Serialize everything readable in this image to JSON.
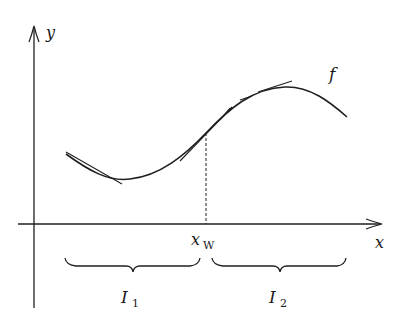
{
  "diagram": {
    "axes": {
      "x_label": "x",
      "y_label": "y"
    },
    "function_label": "f",
    "inflection_point": {
      "label_main": "x",
      "label_sub": "W"
    },
    "intervals": [
      {
        "label_main": "I",
        "label_sub": "1"
      },
      {
        "label_main": "I",
        "label_sub": "2"
      }
    ],
    "colors": {
      "ink": "#1f1f1f",
      "background": "#ffffff"
    }
  }
}
